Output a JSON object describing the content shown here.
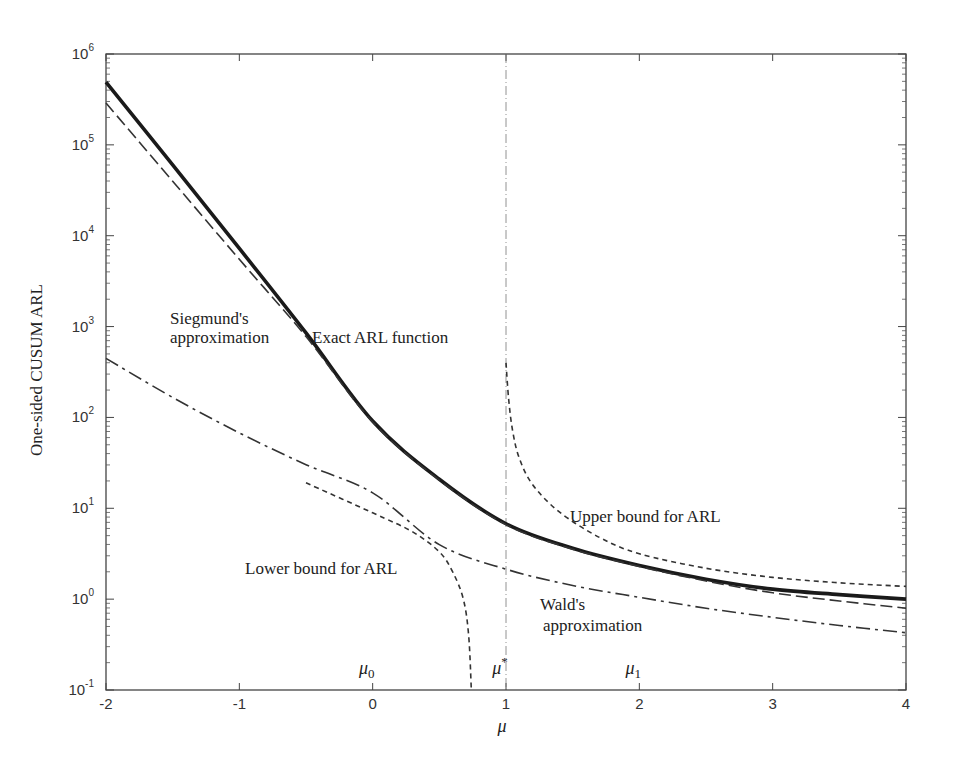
{
  "chart_data": {
    "type": "line",
    "title": "",
    "xlabel": "μ",
    "ylabel": "One-sided CUSUM ARL",
    "xlim": [
      -2,
      4
    ],
    "ylim": [
      0.1,
      1000000
    ],
    "yscale": "log",
    "grid": false,
    "x_ticks": [
      "-2",
      "-1",
      "0",
      "1",
      "2",
      "3",
      "4"
    ],
    "y_ticks": [
      "10^-1",
      "10^0",
      "10^1",
      "10^2",
      "10^3",
      "10^4",
      "10^5",
      "10^6"
    ],
    "series": [
      {
        "name": "Exact ARL function",
        "style": "solid-thick",
        "x": [
          -2,
          -1.5,
          -1,
          -0.5,
          0,
          0.5,
          1,
          1.5,
          2,
          2.5,
          3,
          3.5,
          4
        ],
        "log10_y": [
          5.69,
          4.78,
          3.86,
          2.93,
          1.96,
          1.32,
          0.83,
          0.56,
          0.37,
          0.22,
          0.11,
          0.05,
          0.0
        ]
      },
      {
        "name": "Siegmund's approximation",
        "style": "long-dash",
        "x": [
          -2,
          -1.5,
          -1,
          -0.5,
          0,
          0.5,
          1,
          1.5,
          2,
          2.5,
          3,
          3.5,
          4
        ],
        "log10_y": [
          5.46,
          4.6,
          3.74,
          2.89,
          1.95,
          1.31,
          0.82,
          0.55,
          0.36,
          0.2,
          0.07,
          -0.02,
          -0.1
        ]
      },
      {
        "name": "Wald's approximation",
        "style": "dash-dot",
        "x": [
          -2,
          -1.5,
          -1,
          -0.5,
          0,
          0.5,
          1,
          1.5,
          2,
          2.5,
          3,
          3.5,
          4
        ],
        "log10_y": [
          2.65,
          2.22,
          1.83,
          1.48,
          1.17,
          0.6,
          0.33,
          0.15,
          0.02,
          -0.1,
          -0.2,
          -0.29,
          -0.37
        ]
      },
      {
        "name": "Lower bound for ARL",
        "style": "short-dash",
        "x": [
          -0.5,
          0,
          0.3,
          0.5,
          0.6,
          0.68,
          0.72,
          0.74
        ],
        "log10_y": [
          1.28,
          0.95,
          0.74,
          0.52,
          0.3,
          0.0,
          -0.4,
          -1.0
        ]
      },
      {
        "name": "Upper bound for ARL",
        "style": "short-dash",
        "x": [
          1.0,
          1.02,
          1.05,
          1.1,
          1.2,
          1.4,
          1.7,
          2.0,
          2.5,
          3.0,
          3.5,
          4.0
        ],
        "log10_y": [
          2.6,
          2.2,
          1.85,
          1.55,
          1.26,
          0.96,
          0.68,
          0.5,
          0.34,
          0.24,
          0.18,
          0.14
        ]
      }
    ],
    "reference_lines": [
      {
        "name": "μ*",
        "x": 1,
        "style": "dash-dot-thin"
      }
    ],
    "annotations": [
      {
        "text": "Siegmund's",
        "x_px": 170,
        "y_px": 324
      },
      {
        "text": "approximation",
        "x_px": 170,
        "y_px": 343
      },
      {
        "text": "Exact ARL function",
        "x_px": 312,
        "y_px": 343
      },
      {
        "text": "Upper bound for ARL",
        "x_px": 570,
        "y_px": 522
      },
      {
        "text": "Lower bound for ARL",
        "x_px": 245,
        "y_px": 574
      },
      {
        "text": "Wald's",
        "x_px": 540,
        "y_px": 610
      },
      {
        "text": "approximation",
        "x_px": 543,
        "y_px": 631
      }
    ],
    "mu_labels": [
      {
        "text": "μ",
        "sub": "0",
        "x": 0
      },
      {
        "text": "μ",
        "sup": "*",
        "x": 1
      },
      {
        "text": "μ",
        "sub": "1",
        "x": 2
      }
    ]
  }
}
